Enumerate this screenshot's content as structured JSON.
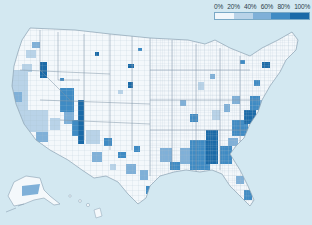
{
  "map": {
    "type": "choropleth",
    "region": "United States counties",
    "background_color": "#d3e8f1",
    "land_color": "#f4f8fb",
    "border_color": "#9fb3c2"
  },
  "legend": {
    "labels": [
      "0%",
      "20%",
      "40%",
      "60%",
      "80%",
      "100%"
    ],
    "bins": [
      {
        "range": "0-20%",
        "color": "#f2f7fb"
      },
      {
        "range": "20-40%",
        "color": "#b9d3e8"
      },
      {
        "range": "40-60%",
        "color": "#7fb0d8"
      },
      {
        "range": "60-80%",
        "color": "#3f8bc4"
      },
      {
        "range": "80-100%",
        "color": "#1a6aa8"
      }
    ]
  }
}
